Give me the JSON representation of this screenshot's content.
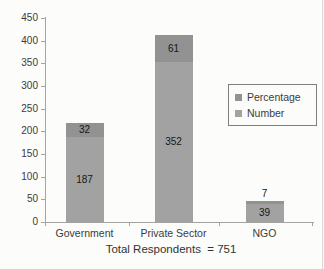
{
  "chart_data": {
    "type": "bar",
    "stacked": true,
    "categories": [
      "Government",
      "Private Sector",
      "NGO"
    ],
    "series": [
      {
        "name": "Number",
        "values": [
          187,
          352,
          39
        ],
        "color": "#a2a2a2"
      },
      {
        "name": "Percentage",
        "values": [
          32,
          61,
          7
        ],
        "color": "#929292"
      }
    ],
    "legend": {
      "position": "right",
      "order": [
        "Percentage",
        "Number"
      ],
      "border_color": "#7f7f7f"
    },
    "ylim": [
      0,
      450
    ],
    "yticks": [
      0,
      50,
      100,
      150,
      200,
      250,
      300,
      350,
      400,
      450
    ],
    "grid": false,
    "xlabel": "",
    "ylabel": "",
    "title": "",
    "caption": "Total Respondents  = 751",
    "colors": {
      "axis": "#a3a3a0",
      "tick_text": "#3b3b3b",
      "bar_label_text": "#161616",
      "background": "#fcfcfa"
    }
  }
}
